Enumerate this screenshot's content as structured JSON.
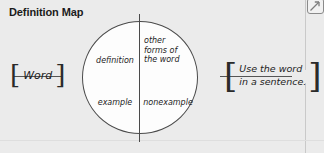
{
  "worksheet": {
    "title": "Definition Map",
    "colors": {
      "background": "#ebebeb",
      "ink": "#1d1d1d",
      "line": "#4a4a4a",
      "circle_fill": "#fdfdfd",
      "frame": "#c9c9c9"
    }
  },
  "expand_control": {
    "icon": "expand-arrow-icon"
  },
  "diagram": {
    "center": {
      "shape": "circle",
      "quadrants": [
        {
          "position": "top-left",
          "label": "definition"
        },
        {
          "position": "top-right",
          "label": "other\nforms of\nthe word"
        },
        {
          "position": "bottom-left",
          "label": "example"
        },
        {
          "position": "bottom-right",
          "label": "nonexample"
        }
      ]
    },
    "left_node": {
      "open_bracket": "[",
      "text": "Word",
      "close_bracket": "]"
    },
    "right_node": {
      "open_bracket": "[",
      "text": "Use the word\nin a sentence.",
      "close_bracket": "]"
    }
  }
}
